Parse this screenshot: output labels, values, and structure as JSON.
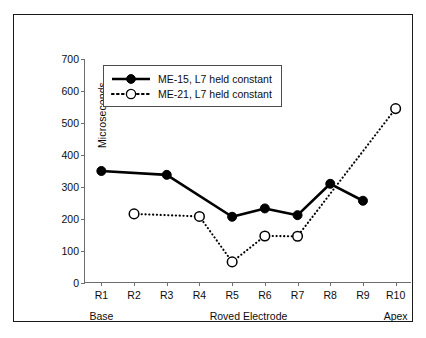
{
  "chart_data": {
    "type": "line",
    "title": "",
    "xlabel": "Roved Electrode",
    "ylabel": "Microseconds",
    "categories": [
      "R1",
      "R2",
      "R3",
      "R4",
      "R5",
      "R6",
      "R7",
      "R8",
      "R9",
      "R10"
    ],
    "ylim": [
      0,
      700
    ],
    "ytick_values": [
      0,
      100,
      200,
      300,
      400,
      500,
      600,
      700
    ],
    "ytick_labels": [
      "0",
      "100",
      "200",
      "300",
      "400",
      "500",
      "600",
      "700"
    ],
    "grid": false,
    "legend_position": "upper-left-inside",
    "series": [
      {
        "name": "ME-15, L7 held constant",
        "marker": "filled-circle",
        "linestyle": "solid",
        "color": "#000000",
        "values": [
          350,
          null,
          338,
          null,
          207,
          233,
          212,
          310,
          257,
          null
        ]
      },
      {
        "name": "ME-21, L7 held constant",
        "marker": "open-circle",
        "linestyle": "dotted",
        "color": "#000000",
        "values": [
          null,
          216,
          null,
          208,
          66,
          147,
          146,
          null,
          null,
          545
        ]
      }
    ],
    "axis_group_labels": [
      {
        "text": "Base",
        "category": "R1"
      },
      {
        "text": "Roved Electrode",
        "category": "R5.5"
      },
      {
        "text": "Apex",
        "category": "R10"
      }
    ]
  },
  "legend": {
    "items": [
      {
        "label": "ME-15, L7 held constant",
        "marker": "filled-circle-icon"
      },
      {
        "label": "ME-21, L7 held constant",
        "marker": "open-circle-icon"
      }
    ]
  },
  "axes": {
    "y_title": "Microseconds",
    "y_ticks": [
      "700",
      "600",
      "500",
      "400",
      "300",
      "200",
      "100",
      "0"
    ],
    "x_ticks": [
      "R1",
      "R2",
      "R3",
      "R4",
      "R5",
      "R6",
      "R7",
      "R8",
      "R9",
      "R10"
    ],
    "group_labels": [
      "Base",
      "Roved Electrode",
      "Apex"
    ]
  },
  "colors": {
    "ink": "#000000",
    "axis": "#6e6e6e",
    "frame": "#1a1a1a",
    "background": "#ffffff"
  }
}
